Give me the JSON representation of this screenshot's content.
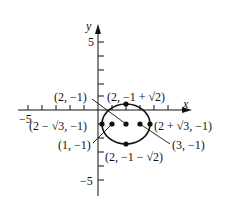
{
  "diagram": {
    "type": "coordinate-graph",
    "title": "",
    "axes": {
      "x_label": "x",
      "y_label": "y",
      "x_tick_label_min": "−5",
      "y_tick_label_max": "5",
      "y_tick_label_min": "−5"
    },
    "circle": {
      "center": [
        2,
        -1
      ],
      "radius_x": 1.732,
      "radius_y": 1.414,
      "shape": "ellipse"
    },
    "points": [
      {
        "name": "center",
        "label": "(2, −1)",
        "x": 2,
        "y": -1
      },
      {
        "name": "top-vertex",
        "label": "(2, −1 + √2)",
        "x": 2,
        "y": 0.414
      },
      {
        "name": "bottom-vertex",
        "label": "(2, −1 − √2)",
        "x": 2,
        "y": -2.414
      },
      {
        "name": "left-vertex",
        "label": "(2 − √3, −1)",
        "x": 0.268,
        "y": -1
      },
      {
        "name": "right-vertex",
        "label": "(2 + √3, −1)",
        "x": 3.732,
        "y": -1
      },
      {
        "name": "left-focus",
        "label": "(1, −1)",
        "x": 1,
        "y": -1
      },
      {
        "name": "right-focus",
        "label": "(3, −1)",
        "x": 3,
        "y": -1
      }
    ],
    "colors": {
      "ink": "#111111",
      "background": "#ffffff"
    }
  }
}
